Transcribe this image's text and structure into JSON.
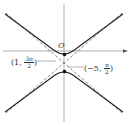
{
  "diagram": {
    "type": "polar-graph-hyperbola",
    "origin_label": "O",
    "points": [
      {
        "label_prefix": "(1, ",
        "num": "3π",
        "den": "2",
        "label_suffix": ")"
      },
      {
        "label_prefix": "(−5, ",
        "num": "π",
        "den": "2",
        "label_suffix": ")"
      }
    ],
    "colors": {
      "curve": "#222222",
      "asymptote": "#555555",
      "axis": "#777777",
      "background": "#ffffff"
    }
  }
}
